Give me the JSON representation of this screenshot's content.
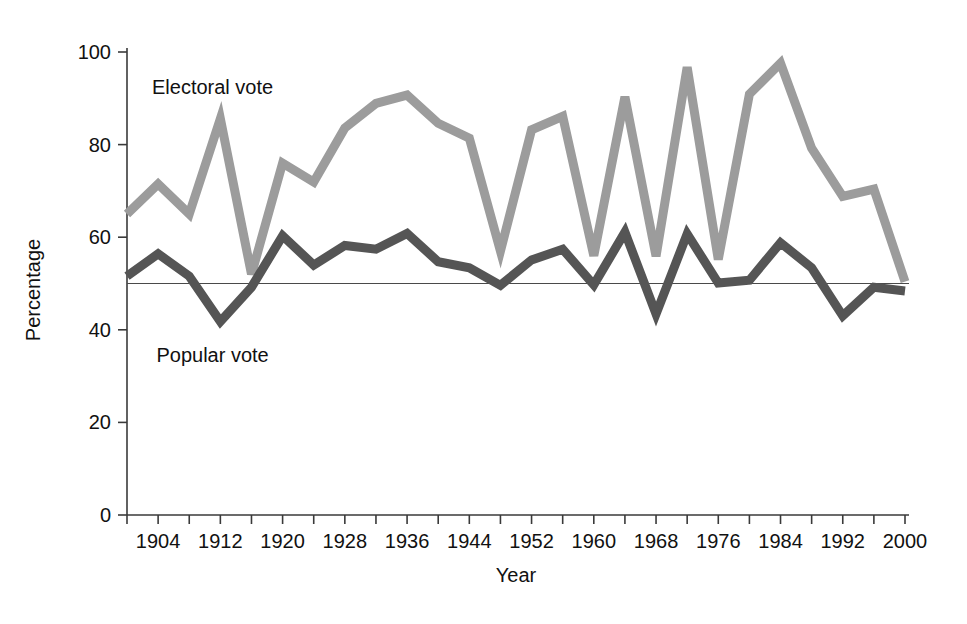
{
  "chart_data": {
    "type": "line",
    "title": "",
    "xlabel": "Year",
    "ylabel": "Percentage",
    "xlim": [
      1900,
      2000
    ],
    "ylim": [
      0,
      108
    ],
    "grid": false,
    "legend_position": "inline-annotation",
    "y_ticks": [
      0,
      20,
      40,
      60,
      80,
      100
    ],
    "y_tick_labels": [
      "0",
      "20",
      "40",
      "60",
      "80",
      "100"
    ],
    "x_ticks": [
      1900,
      1904,
      1908,
      1912,
      1916,
      1920,
      1924,
      1928,
      1932,
      1936,
      1940,
      1944,
      1948,
      1952,
      1956,
      1960,
      1964,
      1968,
      1972,
      1976,
      1980,
      1984,
      1988,
      1992,
      1996,
      2000
    ],
    "x_tick_labels": [
      "",
      "1904",
      "",
      "1912",
      "",
      "1920",
      "",
      "1928",
      "",
      "1936",
      "",
      "1944",
      "",
      "1952",
      "",
      "1960",
      "",
      "1968",
      "",
      "1976",
      "",
      "1984",
      "",
      "1992",
      "",
      "2000"
    ],
    "x": [
      1900,
      1904,
      1908,
      1912,
      1916,
      1920,
      1924,
      1928,
      1932,
      1936,
      1940,
      1944,
      1948,
      1952,
      1956,
      1960,
      1964,
      1968,
      1972,
      1976,
      1980,
      1984,
      1988,
      1992,
      1996,
      2000
    ],
    "reference_line": {
      "value": 50,
      "label": ""
    },
    "series": [
      {
        "name": "Electoral vote",
        "color": "#9c9c9c",
        "stroke_width": 9,
        "label_x": 1911,
        "label_y": 91,
        "values": [
          65,
          71.5,
          65,
          85.6,
          52,
          76,
          71.9,
          83.6,
          88.9,
          90.7,
          84.6,
          81.4,
          57,
          83.2,
          86.1,
          56,
          90.3,
          55.9,
          96.7,
          55.2,
          90.9,
          97.6,
          79.2,
          68.8,
          70.4,
          50.4
        ]
      },
      {
        "name": "Popular vote",
        "color": "#555555",
        "stroke_width": 9,
        "label_x": 1911,
        "label_y": 33,
        "values": [
          51.6,
          56.4,
          51.6,
          41.8,
          49.2,
          60.3,
          54.0,
          58.2,
          57.4,
          60.8,
          54.7,
          53.4,
          49.6,
          55.1,
          57.4,
          49.7,
          61.1,
          43.4,
          60.7,
          50.1,
          50.7,
          58.8,
          53.4,
          43.0,
          49.2,
          48.4
        ]
      }
    ]
  },
  "annotations": {
    "electoral_label": "Electoral vote",
    "popular_label": "Popular vote"
  },
  "axes": {
    "y_title": "Percentage",
    "x_title": "Year"
  }
}
